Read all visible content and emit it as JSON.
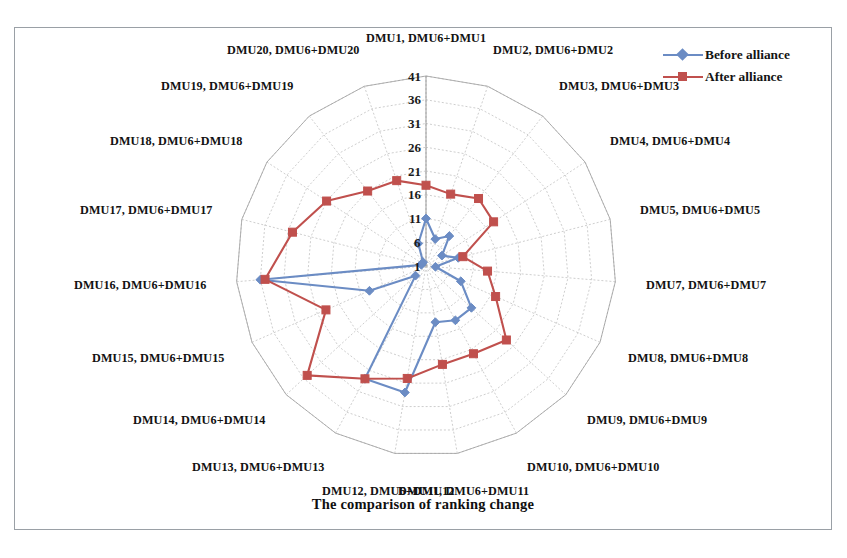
{
  "figure": {
    "title": "The comparison of ranking change",
    "border_color": "#9aa0a6",
    "background": "#ffffff"
  },
  "legend": {
    "position": "top-right",
    "entries": [
      {
        "label": "Before alliance",
        "color": "#6b8cc4",
        "marker": "diamond"
      },
      {
        "label": "After alliance",
        "color": "#c0504d",
        "marker": "square"
      }
    ]
  },
  "chart_data": {
    "type": "radar",
    "title": "The comparison of ranking change",
    "xlabel": "",
    "ylabel": "",
    "grid": true,
    "legend_position": "top-right",
    "rlim": [
      1,
      41
    ],
    "rticks": [
      1,
      6,
      11,
      16,
      21,
      26,
      31,
      36,
      41
    ],
    "rtick_labels": [
      "1",
      "6",
      "11",
      "16",
      "21",
      "26",
      "31",
      "36",
      "41"
    ],
    "categories": [
      "DMU1, DMU6+DMU1",
      "DMU2, DMU6+DMU2",
      "DMU3, DMU6+DMU3",
      "DMU4, DMU6+DMU4",
      "DMU5, DMU6+DMU5",
      "DMU7, DMU6+DMU7",
      "DMU8, DMU6+DMU8",
      "DMU9, DMU6+DMU9",
      "DMU10, DMU6+DMU10",
      "DMU11, DMU6+DMU11",
      "DMU12, DMU6+DMU12",
      "DMU13, DMU6+DMU13",
      "DMU14, DMU6+DMU14",
      "DMU15, DMU6+DMU15",
      "DMU16, DMU6+DMU16",
      "DMU17, DMU6+DMU17",
      "DMU18, DMU6+DMU18",
      "DMU19, DMU6+DMU19",
      "DMU20, DMU6+DMU20"
    ],
    "series": [
      {
        "name": "Before alliance",
        "color": "#6b8cc4",
        "marker": "diamond",
        "values": [
          11,
          7,
          9,
          5,
          8,
          3,
          9,
          14,
          14,
          13,
          28,
          28,
          4,
          14,
          36,
          2,
          2,
          2,
          6
        ]
      },
      {
        "name": "After alliance",
        "color": "#c0504d",
        "marker": "square",
        "values": [
          18,
          17,
          19,
          18,
          9,
          14,
          17,
          24,
          22,
          22,
          25,
          28,
          35,
          24,
          35,
          30,
          26,
          21,
          20
        ]
      }
    ]
  },
  "radial_axis": {
    "ticks": [
      "1",
      "6",
      "11",
      "16",
      "21",
      "26",
      "31",
      "36",
      "41"
    ]
  }
}
